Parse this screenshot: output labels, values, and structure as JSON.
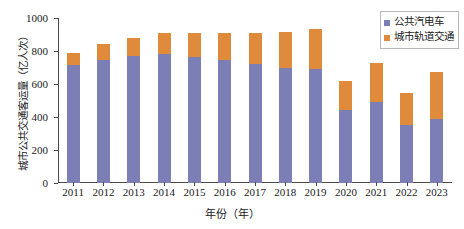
{
  "chart_data": {
    "type": "bar",
    "stacked": true,
    "title": "",
    "xlabel": "年份（年）",
    "ylabel": "城市公共交通客运量（亿人次）",
    "categories": [
      "2011",
      "2012",
      "2013",
      "2014",
      "2015",
      "2016",
      "2017",
      "2018",
      "2019",
      "2020",
      "2021",
      "2022",
      "2023"
    ],
    "series": [
      {
        "name": "公共汽电车",
        "color": "#7b7fb5",
        "values": [
          715,
          745,
          770,
          782,
          765,
          745,
          722,
          700,
          690,
          442,
          490,
          353,
          385
        ]
      },
      {
        "name": "城市轨道交通",
        "color": "#e08a3c",
        "values": [
          70,
          95,
          110,
          128,
          145,
          165,
          188,
          215,
          245,
          178,
          240,
          192,
          290
        ]
      }
    ],
    "totals": [
      785,
      840,
      880,
      910,
      910,
      910,
      910,
      915,
      935,
      620,
      730,
      545,
      675
    ],
    "yticks": [
      0,
      200,
      400,
      600,
      800,
      1000
    ],
    "ytick_labels": [
      "0",
      "200",
      "400",
      "600",
      "800",
      "1000"
    ],
    "ylim": [
      0,
      1000
    ],
    "grid": false,
    "legend_position": "top-right"
  },
  "legend": {
    "items": [
      {
        "label": "公共汽电车",
        "color": "#7b7fb5"
      },
      {
        "label": "城市轨道交通",
        "color": "#e08a3c"
      }
    ]
  }
}
